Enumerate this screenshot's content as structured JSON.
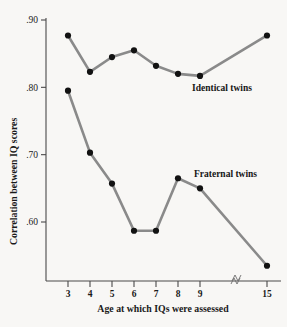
{
  "chart_data": {
    "type": "line",
    "title": "",
    "xlabel": "Age at which IQs were assessed",
    "ylabel": "Correlation between IQ scores",
    "x": [
      3,
      4,
      5,
      6,
      7,
      8,
      9,
      15
    ],
    "xtick_labels": [
      "3",
      "4",
      "5",
      "6",
      "7",
      "8",
      "9",
      "15"
    ],
    "ytick_labels": [
      ".90",
      ".80",
      ".70",
      ".60"
    ],
    "ytick_values": [
      0.9,
      0.8,
      0.7,
      0.6
    ],
    "ylim": [
      0.515,
      0.905
    ],
    "grid": false,
    "legend_position": "inline-right",
    "x_axis_break_after": 9,
    "series": [
      {
        "name": "Identical twins",
        "label": "Identical twins",
        "color": "#8a8a8a",
        "marker_color": "#121212",
        "values": [
          0.877,
          0.823,
          0.845,
          0.855,
          0.832,
          0.82,
          0.817,
          0.877
        ]
      },
      {
        "name": "Fraternal twins",
        "label": "Fraternal twins",
        "color": "#8a8a8a",
        "marker_color": "#121212",
        "values": [
          0.795,
          0.703,
          0.657,
          0.587,
          0.587,
          0.665,
          0.65,
          0.535
        ]
      }
    ]
  },
  "colors": {
    "background": "#f8f7f5",
    "line": "#8a8a8a",
    "marker": "#121212",
    "axis": "#4a4a4a",
    "text": "#1a1a1a"
  }
}
